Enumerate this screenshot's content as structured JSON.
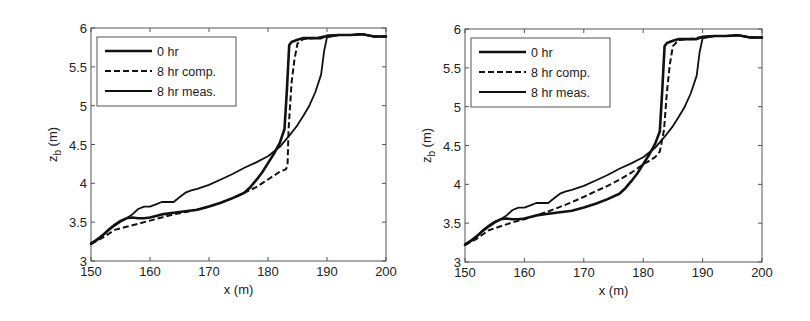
{
  "chart_data": [
    {
      "type": "line",
      "panel": "left",
      "title": "",
      "xlabel": "x (m)",
      "ylabel": "z_b (m)",
      "ylabel_main": "z",
      "ylabel_sub": "b",
      "ylabel_unit": "(m)",
      "xlim": [
        150,
        200
      ],
      "ylim": [
        3,
        6
      ],
      "xticks": [
        150,
        160,
        170,
        180,
        190,
        200
      ],
      "yticks": [
        3,
        3.5,
        4,
        4.5,
        5,
        5.5,
        6
      ],
      "xtick_labels": [
        "150",
        "160",
        "170",
        "180",
        "190",
        "200"
      ],
      "ytick_labels": [
        "3",
        "3.5",
        "4",
        "4.5",
        "5",
        "5.5",
        "6"
      ],
      "grid": false,
      "legend_position": "upper left",
      "series": [
        {
          "name": "0 hr",
          "style": "solid-thick",
          "x": [
            150,
            151,
            152,
            153,
            154,
            155,
            156,
            157,
            158,
            159,
            160,
            162,
            164,
            166,
            168,
            170,
            172,
            174,
            176,
            177,
            178,
            179,
            180,
            181,
            182,
            182.8,
            183.2,
            183.6,
            184,
            185,
            186,
            187,
            188,
            189,
            190,
            192,
            194,
            196,
            198,
            200
          ],
          "y": [
            3.22,
            3.27,
            3.33,
            3.4,
            3.46,
            3.51,
            3.55,
            3.56,
            3.55,
            3.55,
            3.56,
            3.6,
            3.62,
            3.64,
            3.66,
            3.7,
            3.75,
            3.81,
            3.88,
            3.95,
            4.04,
            4.14,
            4.26,
            4.38,
            4.52,
            4.7,
            5.2,
            5.78,
            5.82,
            5.85,
            5.87,
            5.87,
            5.87,
            5.87,
            5.9,
            5.91,
            5.91,
            5.92,
            5.89,
            5.89
          ]
        },
        {
          "name": "8 hr comp.",
          "style": "dashed",
          "x": [
            150,
            152,
            154,
            156,
            158,
            160,
            162,
            164,
            166,
            168,
            170,
            172,
            174,
            176,
            178,
            180,
            182,
            183,
            183.3,
            183.5,
            184,
            184.5,
            185,
            186,
            188,
            190,
            192,
            194,
            196,
            198,
            200
          ],
          "y": [
            3.22,
            3.3,
            3.4,
            3.44,
            3.48,
            3.52,
            3.56,
            3.6,
            3.63,
            3.66,
            3.7,
            3.75,
            3.81,
            3.88,
            3.95,
            4.05,
            4.15,
            4.18,
            4.22,
            4.7,
            5.3,
            5.6,
            5.8,
            5.86,
            5.87,
            5.9,
            5.91,
            5.91,
            5.92,
            5.89,
            5.89
          ]
        },
        {
          "name": "8 hr meas.",
          "style": "solid",
          "x": [
            150,
            151,
            152,
            153,
            154,
            155,
            156,
            157,
            158,
            159,
            160,
            161,
            162,
            163,
            164,
            165,
            166,
            167,
            168,
            170,
            172,
            174,
            176,
            178,
            180,
            182,
            183,
            184,
            185,
            186,
            187,
            188,
            189,
            189.5,
            190,
            192,
            194,
            196,
            198,
            200
          ],
          "y": [
            3.23,
            3.28,
            3.34,
            3.41,
            3.47,
            3.52,
            3.55,
            3.6,
            3.67,
            3.7,
            3.7,
            3.73,
            3.76,
            3.76,
            3.76,
            3.82,
            3.88,
            3.91,
            3.93,
            3.98,
            4.05,
            4.12,
            4.2,
            4.27,
            4.35,
            4.47,
            4.56,
            4.65,
            4.75,
            4.87,
            5.0,
            5.17,
            5.4,
            5.7,
            5.88,
            5.91,
            5.91,
            5.92,
            5.89,
            5.89
          ]
        }
      ]
    },
    {
      "type": "line",
      "panel": "right",
      "title": "",
      "xlabel": "x (m)",
      "ylabel": "z_b (m)",
      "ylabel_main": "z",
      "ylabel_sub": "b",
      "ylabel_unit": "(m)",
      "xlim": [
        150,
        200
      ],
      "ylim": [
        3,
        6
      ],
      "xticks": [
        150,
        160,
        170,
        180,
        190,
        200
      ],
      "yticks": [
        3,
        3.5,
        4,
        4.5,
        5,
        5.5,
        6
      ],
      "xtick_labels": [
        "150",
        "160",
        "170",
        "180",
        "190",
        "200"
      ],
      "ytick_labels": [
        "3",
        "3.5",
        "4",
        "4.5",
        "5",
        "5.5",
        "6"
      ],
      "grid": false,
      "legend_position": "upper left",
      "series": [
        {
          "name": "0 hr",
          "style": "solid-thick",
          "x": [
            150,
            151,
            152,
            153,
            154,
            155,
            156,
            157,
            158,
            159,
            160,
            162,
            164,
            166,
            168,
            170,
            172,
            174,
            176,
            177,
            178,
            179,
            180,
            181,
            182,
            182.8,
            183.2,
            183.6,
            184,
            185,
            186,
            187,
            188,
            189,
            190,
            192,
            194,
            196,
            198,
            200
          ],
          "y": [
            3.22,
            3.27,
            3.33,
            3.4,
            3.46,
            3.51,
            3.55,
            3.56,
            3.55,
            3.55,
            3.56,
            3.6,
            3.62,
            3.64,
            3.66,
            3.7,
            3.75,
            3.81,
            3.88,
            3.95,
            4.04,
            4.14,
            4.26,
            4.38,
            4.52,
            4.68,
            5.2,
            5.78,
            5.82,
            5.85,
            5.87,
            5.87,
            5.87,
            5.87,
            5.9,
            5.91,
            5.91,
            5.92,
            5.89,
            5.89
          ]
        },
        {
          "name": "8 hr comp.",
          "style": "dashed",
          "x": [
            150,
            152,
            154,
            156,
            158,
            160,
            162,
            164,
            166,
            168,
            170,
            172,
            174,
            176,
            178,
            180,
            181,
            182,
            182.8,
            183.5,
            184,
            184.5,
            185,
            186,
            188,
            190,
            192,
            194,
            196,
            198,
            200
          ],
          "y": [
            3.22,
            3.3,
            3.41,
            3.46,
            3.51,
            3.55,
            3.6,
            3.65,
            3.71,
            3.77,
            3.84,
            3.91,
            3.98,
            4.06,
            4.15,
            4.26,
            4.3,
            4.35,
            4.42,
            4.7,
            5.2,
            5.55,
            5.78,
            5.86,
            5.87,
            5.9,
            5.91,
            5.91,
            5.92,
            5.89,
            5.89
          ]
        },
        {
          "name": "8 hr meas.",
          "style": "solid",
          "x": [
            150,
            151,
            152,
            153,
            154,
            155,
            156,
            157,
            158,
            159,
            160,
            161,
            162,
            163,
            164,
            165,
            166,
            167,
            168,
            170,
            172,
            174,
            176,
            178,
            180,
            182,
            183,
            184,
            185,
            186,
            187,
            188,
            189,
            189.5,
            190,
            192,
            194,
            196,
            198,
            200
          ],
          "y": [
            3.23,
            3.28,
            3.34,
            3.41,
            3.47,
            3.52,
            3.55,
            3.6,
            3.67,
            3.7,
            3.7,
            3.73,
            3.76,
            3.76,
            3.76,
            3.82,
            3.88,
            3.91,
            3.93,
            3.98,
            4.05,
            4.12,
            4.2,
            4.27,
            4.35,
            4.47,
            4.56,
            4.65,
            4.75,
            4.87,
            5.0,
            5.17,
            5.4,
            5.7,
            5.88,
            5.91,
            5.91,
            5.92,
            5.89,
            5.89
          ]
        }
      ]
    }
  ],
  "colors": {
    "line": "#111111",
    "axis": "#555555",
    "text": "#222222",
    "background": "#ffffff"
  }
}
